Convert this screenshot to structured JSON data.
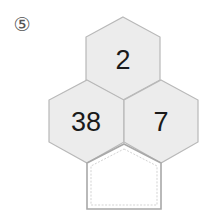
{
  "problem": {
    "label": "⑤",
    "cells": [
      {
        "position": "top",
        "value": "2"
      },
      {
        "position": "middle-left",
        "value": "38"
      },
      {
        "position": "middle-right",
        "value": "7"
      },
      {
        "position": "bottom",
        "value": ""
      }
    ],
    "colors": {
      "hex_fill": "#ececec",
      "hex_stroke": "#b5b5b5",
      "answer_box_stroke": "#a8a8a8"
    }
  }
}
